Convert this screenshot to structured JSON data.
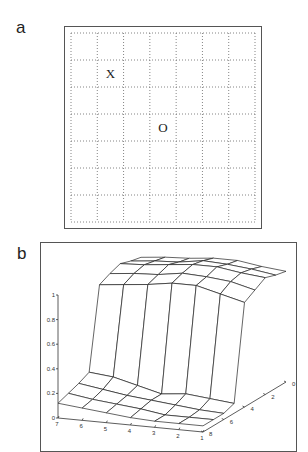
{
  "panels": {
    "a": {
      "label": "a"
    },
    "b": {
      "label": "b"
    }
  },
  "chart_data": [
    {
      "type": "table",
      "title": "",
      "grid": {
        "rows": 7,
        "cols": 7,
        "style": "dotted"
      },
      "markers": [
        {
          "text": "X",
          "row": 1,
          "col": 1
        },
        {
          "text": "O",
          "row": 3,
          "col": 3
        }
      ]
    },
    {
      "type": "surface",
      "title": "",
      "zlim": [
        0,
        1
      ],
      "z_ticks": [
        "0",
        "0.2",
        "0.4",
        "0.6",
        "0.8",
        "1"
      ],
      "x_ticks": [
        "7",
        "6",
        "5",
        "4",
        "3",
        "2",
        "1"
      ],
      "y_ticks": [
        "0",
        "2",
        "4",
        "6",
        "8"
      ],
      "x": [
        1,
        2,
        3,
        4,
        5,
        6,
        7
      ],
      "y": [
        0,
        1,
        2,
        3,
        4,
        5,
        6,
        7,
        8
      ],
      "z": [
        [
          0.9,
          0.92,
          0.95,
          0.9,
          0.85,
          0.08,
          0.05,
          0.05,
          0.05
        ],
        [
          0.92,
          0.95,
          0.97,
          0.95,
          0.9,
          0.1,
          0.06,
          0.05,
          0.05
        ],
        [
          0.95,
          0.97,
          1.0,
          0.97,
          0.95,
          0.12,
          0.08,
          0.05,
          0.05
        ],
        [
          0.95,
          0.98,
          1.0,
          0.98,
          0.95,
          0.1,
          0.1,
          0.08,
          0.06
        ],
        [
          0.93,
          0.95,
          0.98,
          0.95,
          0.92,
          0.15,
          0.12,
          0.1,
          0.08
        ],
        [
          0.92,
          0.94,
          0.96,
          0.94,
          0.9,
          0.2,
          0.15,
          0.12,
          0.1
        ],
        [
          0.9,
          0.92,
          0.95,
          0.92,
          0.88,
          0.22,
          0.18,
          0.15,
          0.12
        ]
      ]
    }
  ]
}
